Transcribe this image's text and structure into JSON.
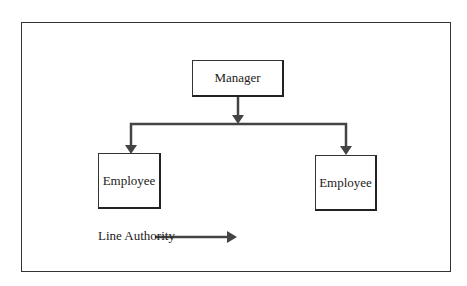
{
  "diagram": {
    "manager": {
      "label": "Manager"
    },
    "employees": [
      {
        "label": "Employee"
      },
      {
        "label": "Employee"
      }
    ],
    "legend": {
      "label": "Line Authority"
    },
    "colors": {
      "line": "#444444",
      "border": "#222222",
      "background": "#ffffff"
    }
  }
}
